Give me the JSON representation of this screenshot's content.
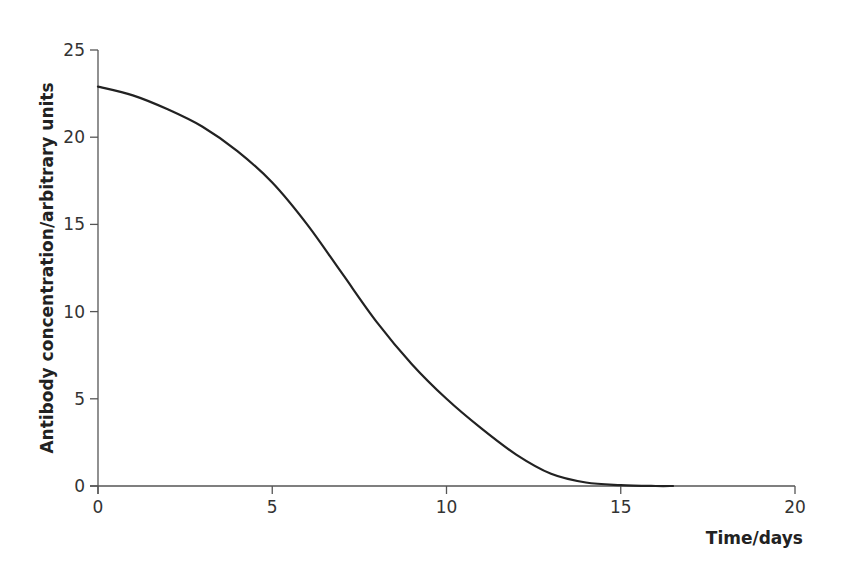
{
  "chart_data": {
    "type": "line",
    "title": "",
    "xlabel": "Time/days",
    "ylabel": "Antibody concentration/arbitrary units",
    "xlim": [
      0,
      20
    ],
    "ylim": [
      0,
      25
    ],
    "x_ticks": [
      0,
      5,
      10,
      15,
      20
    ],
    "y_ticks": [
      0,
      5,
      10,
      15,
      20,
      25
    ],
    "grid": false,
    "legend": null,
    "series": [
      {
        "name": "Antibody concentration",
        "color": "#222222",
        "x": [
          0,
          1,
          2,
          3,
          4,
          5,
          6,
          7,
          8,
          9,
          10,
          11,
          12,
          13,
          14,
          15,
          16,
          16.5
        ],
        "values": [
          22.9,
          22.4,
          21.6,
          20.6,
          19.2,
          17.4,
          15.0,
          12.2,
          9.4,
          7.0,
          5.0,
          3.3,
          1.8,
          0.7,
          0.2,
          0.05,
          0.0,
          0.0
        ]
      }
    ]
  },
  "layout": {
    "plot_left": 98,
    "plot_right": 795,
    "plot_top": 50,
    "plot_bottom": 486,
    "axis_color": "#555555"
  }
}
